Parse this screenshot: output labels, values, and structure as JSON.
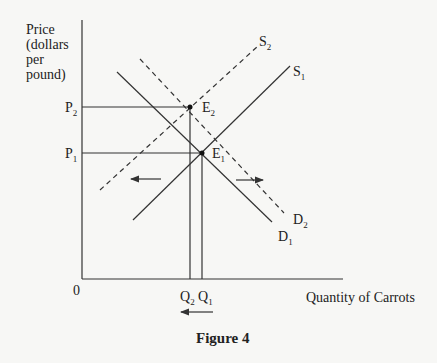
{
  "figure": {
    "title": "Figure 4",
    "y_axis_label": [
      "Price",
      "(dollars",
      "per",
      "pound)"
    ],
    "x_axis_label": "Quantity of Carrots",
    "origin_label": "0",
    "price_labels": [
      {
        "base": "P",
        "sub": "2"
      },
      {
        "base": "P",
        "sub": "1"
      }
    ],
    "quantity_labels": [
      {
        "base": "Q",
        "sub": "2"
      },
      {
        "base": "Q",
        "sub": "1"
      }
    ],
    "equilibria": [
      {
        "base": "E",
        "sub": "2"
      },
      {
        "base": "E",
        "sub": "1"
      }
    ],
    "curves": {
      "S2": {
        "base": "S",
        "sub": "2",
        "style": "dashed"
      },
      "S1": {
        "base": "S",
        "sub": "1",
        "style": "solid"
      },
      "D2": {
        "base": "D",
        "sub": "2",
        "style": "dashed"
      },
      "D1": {
        "base": "D",
        "sub": "1",
        "style": "solid"
      }
    },
    "arrows": [
      "left (supply shifts left)",
      "right (demand shifts right)",
      "left (quantity decreases)"
    ]
  },
  "colors": {
    "line": "#333333",
    "background": "#f7f7f5"
  }
}
